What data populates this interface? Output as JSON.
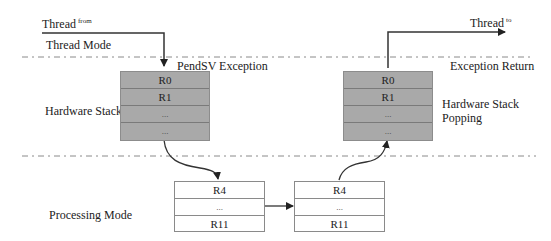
{
  "labels": {
    "thread_from_main": "Thread",
    "thread_from_sup": "from",
    "thread_to_main": "Thread",
    "thread_to_sup": "to",
    "thread_mode": "Thread Mode",
    "pendsv_exception": "PendSV Exception",
    "exception_return": "Exception Return",
    "hardware_stack": "Hardware Stack",
    "hardware_stack_popping_1": "Hardware Stack",
    "hardware_stack_popping_2": "Popping",
    "processing_mode": "Processing Mode"
  },
  "hw_stack_push": {
    "cells": [
      "R0",
      "R1",
      "...",
      "..."
    ]
  },
  "hw_stack_pop": {
    "cells": [
      "R0",
      "R1",
      "...",
      "..."
    ]
  },
  "sw_stack_save": {
    "cells": [
      "R4",
      "...",
      "R11"
    ]
  },
  "sw_stack_restore": {
    "cells": [
      "R4",
      "...",
      "R11"
    ]
  },
  "colors": {
    "hw_stack_fill": "#a9a9a9",
    "sw_stack_fill": "#ffffff",
    "arrow": "#222222",
    "dashed_line": "#8a8a8a"
  }
}
